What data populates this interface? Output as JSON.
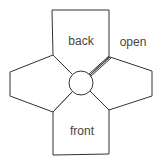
{
  "diagram": {
    "title": "",
    "labels": {
      "back": "back",
      "front": "front",
      "open": "open"
    },
    "panels": [
      {
        "name": "back",
        "position": "top"
      },
      {
        "name": "left",
        "position": "left"
      },
      {
        "name": "right",
        "position": "right"
      },
      {
        "name": "front",
        "position": "bottom"
      }
    ],
    "center": {
      "shape": "circle"
    },
    "open_seam": {
      "between": [
        "back",
        "right"
      ],
      "style": "double-line"
    },
    "colors": {
      "stroke": "#333333",
      "text": "#444444",
      "background": "#ffffff"
    }
  }
}
